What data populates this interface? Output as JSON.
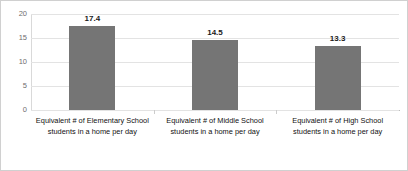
{
  "chart_data": {
    "type": "bar",
    "title": "",
    "subtitle": "",
    "xlabel": "",
    "ylabel": "",
    "ylim": [
      0,
      20
    ],
    "yticks": [
      "0",
      "5",
      "10",
      "15",
      "20"
    ],
    "ytick_values": [
      0,
      5,
      10,
      15,
      20
    ],
    "grid": true,
    "legend": "none",
    "bar_color": "#757575",
    "categories": [
      "Equivalent # of Elementary School students in a home per day",
      "Equivalent # of Middle School students in a home per day",
      "Equivalent # of High School students in a home per day"
    ],
    "values": [
      17.4,
      14.5,
      13.3
    ],
    "data_labels": [
      "17.4",
      "14.5",
      "13.3"
    ]
  }
}
